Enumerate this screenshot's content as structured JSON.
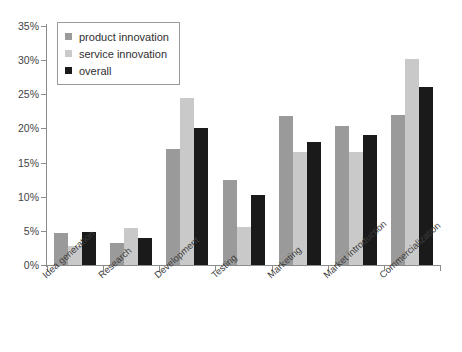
{
  "chart_data": {
    "type": "bar",
    "title": "",
    "xlabel": "",
    "ylabel": "",
    "ylim": [
      0,
      35
    ],
    "y_tick_step": 5,
    "grid": false,
    "legend_position": "top-left",
    "y_ticks": [
      "0%",
      "5%",
      "10%",
      "15%",
      "20%",
      "25%",
      "30%",
      "35%"
    ],
    "categories": [
      "Idea generation",
      "Research",
      "Development",
      "Testing",
      "Marketing",
      "Market introduction",
      "Commercialization"
    ],
    "series": [
      {
        "name": "product innovation",
        "color": "#9a9a9a",
        "values": [
          4.7,
          3.2,
          17.0,
          12.5,
          21.8,
          20.4,
          21.9
        ]
      },
      {
        "name": "service innovation",
        "color": "#c9c9c9",
        "values": [
          2.8,
          5.4,
          24.4,
          5.5,
          16.5,
          16.5,
          30.2
        ]
      },
      {
        "name": "overall",
        "color": "#1a1a1a",
        "values": [
          4.9,
          3.9,
          20.0,
          10.2,
          18.0,
          19.0,
          26.1
        ]
      }
    ]
  },
  "axis": {
    "line_color": "#8c8c8c"
  }
}
